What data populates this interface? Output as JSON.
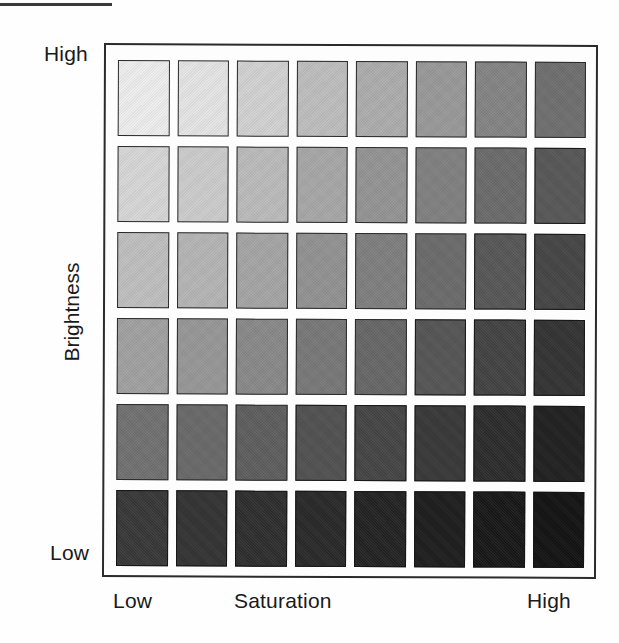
{
  "figure": {
    "type": "color-matrix",
    "top_rule": true,
    "frame_visible": true
  },
  "axes": {
    "y": {
      "title": "Brightness",
      "high_label": "High",
      "low_label": "Low",
      "direction": "high at top, low at bottom"
    },
    "x": {
      "title": "Saturation",
      "low_label": "Low",
      "high_label": "High",
      "direction": "low at left, high at right"
    }
  },
  "chart_data": {
    "type": "heatmap",
    "title": "",
    "subtitle": "",
    "xlabel": "Saturation",
    "ylabel": "Brightness",
    "rows": 6,
    "cols": 8,
    "grid": true,
    "legend": "none",
    "x_ticklabels": [
      "Low",
      "",
      "",
      "",
      "",
      "",
      "",
      "High"
    ],
    "y_ticklabels": [
      "High",
      "",
      "",
      "",
      "",
      "Low"
    ],
    "value_meaning": "grey level of printed swatch (0 = black, 255 = white)",
    "values": [
      [
        237,
        228,
        209,
        189,
        172,
        152,
        131,
        110
      ],
      [
        214,
        203,
        186,
        166,
        147,
        127,
        106,
        86
      ],
      [
        190,
        180,
        164,
        145,
        126,
        106,
        86,
        68
      ],
      [
        160,
        150,
        136,
        119,
        102,
        84,
        66,
        50
      ],
      [
        112,
        104,
        93,
        80,
        68,
        55,
        43,
        31
      ],
      [
        55,
        50,
        45,
        40,
        34,
        28,
        23,
        18
      ]
    ],
    "colors": [
      [
        "#ededed",
        "#e4e4e4",
        "#d1d1d1",
        "#bdbdbd",
        "#acacac",
        "#989898",
        "#838383",
        "#6e6e6e"
      ],
      [
        "#d6d6d6",
        "#cbcbcb",
        "#bababa",
        "#a6a6a6",
        "#939393",
        "#7f7f7f",
        "#6a6a6a",
        "#565656"
      ],
      [
        "#bebebe",
        "#b4b4b4",
        "#a4a4a4",
        "#919191",
        "#7e7e7e",
        "#6a6a6a",
        "#565656",
        "#444444"
      ],
      [
        "#a0a0a0",
        "#969696",
        "#888888",
        "#777777",
        "#666666",
        "#545454",
        "#424242",
        "#323232"
      ],
      [
        "#707070",
        "#686868",
        "#5d5d5d",
        "#505050",
        "#444444",
        "#373737",
        "#2b2b2b",
        "#1f1f1f"
      ],
      [
        "#373737",
        "#323232",
        "#2d2d2d",
        "#282828",
        "#222222",
        "#1c1c1c",
        "#171717",
        "#121212"
      ]
    ]
  },
  "colors": {
    "background": "#fefefe",
    "ink": "#1a1a1a",
    "frame": "#2b2b2b",
    "swatch_border": "#2a2a2a",
    "rule": "#3a3a3a"
  }
}
